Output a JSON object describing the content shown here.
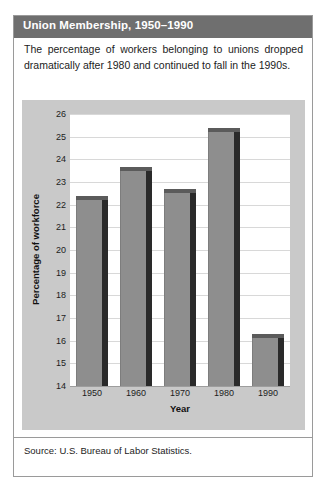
{
  "figure": {
    "title": "Union Membership, 1950–1990",
    "description": "The percentage of workers belonging to unions dropped dramatically after 1980 and continued to fall in the 1990s.",
    "source": "Source: U.S. Bureau of Labor Statistics.",
    "colors": {
      "title_bar": "#6f6f6f",
      "title_text": "#ffffff",
      "chart_background": "#c9c9c9",
      "plot_background": "#ffffff",
      "bar_front": "#8e8e8e",
      "bar_side": "#2a2a2a",
      "bar_top": "#5b5b5b",
      "gridline": "#d8d8d8",
      "border": "#9a9a9a"
    }
  },
  "chart_data": {
    "type": "bar",
    "title": "Union Membership, 1950–1990",
    "categories": [
      "1950",
      "1960",
      "1970",
      "1980",
      "1990"
    ],
    "values": [
      22.2,
      23.5,
      22.5,
      25.2,
      16.1
    ],
    "xlabel": "Year",
    "ylabel": "Percentage of workforce",
    "ylim": [
      14,
      26
    ],
    "ytick_values": [
      14,
      15,
      16,
      17,
      18,
      19,
      20,
      21,
      22,
      23,
      24,
      25,
      26
    ],
    "ytick_labels": [
      "14",
      "15",
      "16",
      "17",
      "18",
      "19",
      "20",
      "21",
      "22",
      "23",
      "24",
      "25",
      "26"
    ],
    "grid": true,
    "legend": false,
    "series": [
      {
        "name": "Percentage of workforce",
        "values": [
          22.2,
          23.5,
          22.5,
          25.2,
          16.1
        ]
      }
    ]
  }
}
